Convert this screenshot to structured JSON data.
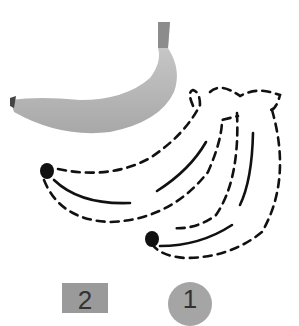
{
  "illustration": {
    "photo": "banana-photo",
    "drawing": "banana-bunch-dashed-outline",
    "colors": {
      "banana_fill": "#bdbdbd",
      "banana_shade": "#a3a3a3",
      "stem": "#8c8c8c",
      "outline": "#111111"
    }
  },
  "labels": {
    "square_number": "2",
    "circle_number": "1"
  }
}
